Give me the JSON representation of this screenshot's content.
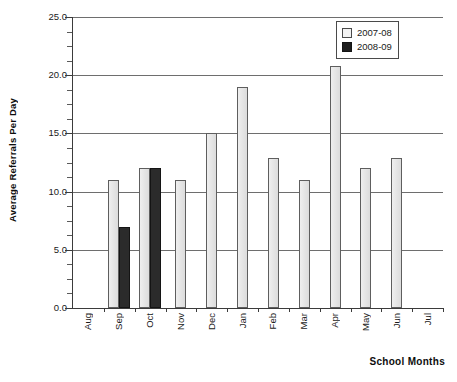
{
  "chart_data": {
    "type": "bar",
    "title": "",
    "subtitle": "",
    "xlabel": "School Months",
    "ylabel": "Average Referrals Per Day",
    "categories": [
      "Aug",
      "Sep",
      "Oct",
      "Nov",
      "Dec",
      "Jan",
      "Feb",
      "Mar",
      "Apr",
      "May",
      "Jun",
      "Jul"
    ],
    "series": [
      {
        "name": "2007-08",
        "color": "#eaeaea",
        "values": [
          0,
          11,
          12,
          11,
          15,
          19,
          12.9,
          11,
          20.8,
          12,
          12.9,
          0
        ]
      },
      {
        "name": "2008-09",
        "color": "#2b2b2b",
        "values": [
          0,
          7,
          12,
          0,
          0,
          0,
          0,
          0,
          0,
          0,
          0,
          0
        ]
      }
    ],
    "ylim": [
      0,
      25
    ],
    "yticks": [
      0,
      5,
      10,
      15,
      20,
      25
    ],
    "ytick_labels": [
      "0.0",
      "5.0",
      "10.0",
      "15.0",
      "20.0",
      "25.0"
    ],
    "y_minor_tick_step": 1.25,
    "grid": "horizontal",
    "legend_position": "top-right"
  },
  "axes": {
    "y_title": "Average Referrals Per Day",
    "x_title": "School Months"
  },
  "legend": {
    "entries": [
      {
        "label": "2007-08",
        "swatch": "light-square-swatch"
      },
      {
        "label": "2008-09",
        "swatch": "dark-square-swatch"
      }
    ]
  }
}
